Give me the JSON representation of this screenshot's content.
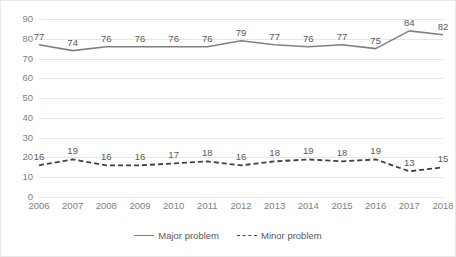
{
  "chart_data": {
    "type": "line",
    "title": "",
    "xlabel": "",
    "ylabel": "",
    "ylim": [
      0,
      90
    ],
    "yticks": [
      0,
      10,
      20,
      30,
      40,
      50,
      60,
      70,
      80,
      90
    ],
    "grid": true,
    "legend_position": "bottom",
    "categories": [
      "2006",
      "2007",
      "2008",
      "2009",
      "2010",
      "2011",
      "2012",
      "2013",
      "2014",
      "2015",
      "2016",
      "2017",
      "2018"
    ],
    "series": [
      {
        "name": "Major problem",
        "style": "solid",
        "color": "#808080",
        "values": [
          77,
          74,
          76,
          76,
          76,
          76,
          79,
          77,
          76,
          77,
          75,
          84,
          82
        ]
      },
      {
        "name": "Minor problem",
        "style": "dashed",
        "color": "#404040",
        "values": [
          16,
          19,
          16,
          16,
          17,
          18,
          16,
          18,
          19,
          18,
          19,
          13,
          15
        ]
      }
    ]
  },
  "colors": {
    "grid": "#e6e6e6",
    "border": "#e8e8e8",
    "tick_text": "#808080",
    "label_text": "#595959",
    "major_line": "#808080",
    "minor_line": "#404040"
  }
}
